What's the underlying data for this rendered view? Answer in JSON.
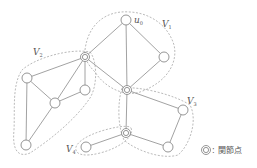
{
  "diagram": {
    "type": "graph-biconnected-components",
    "vertex_label": {
      "base": "u",
      "sub": "0"
    },
    "components": [
      {
        "id": "V1",
        "base": "V",
        "sub": "1"
      },
      {
        "id": "V2",
        "base": "V",
        "sub": "2"
      },
      {
        "id": "V3",
        "base": "V",
        "sub": "3"
      },
      {
        "id": "V4",
        "base": "V",
        "sub": "4"
      }
    ],
    "legend": {
      "symbol": "double-circle",
      "separator": ":",
      "label": "関節点"
    },
    "nodes": [
      {
        "id": "u0",
        "x": 126,
        "y": 20,
        "articulation": false
      },
      {
        "id": "a",
        "x": 85,
        "y": 57,
        "articulation": true
      },
      {
        "id": "b",
        "x": 164,
        "y": 57,
        "articulation": false
      },
      {
        "id": "c",
        "x": 127,
        "y": 90,
        "articulation": true
      },
      {
        "id": "d",
        "x": 27,
        "y": 78,
        "articulation": false
      },
      {
        "id": "e",
        "x": 55,
        "y": 103,
        "articulation": false
      },
      {
        "id": "f",
        "x": 85,
        "y": 90,
        "articulation": false
      },
      {
        "id": "g",
        "x": 26,
        "y": 145,
        "articulation": false
      },
      {
        "id": "h",
        "x": 126,
        "y": 133,
        "articulation": true
      },
      {
        "id": "i",
        "x": 183,
        "y": 110,
        "articulation": false
      },
      {
        "id": "j",
        "x": 168,
        "y": 147,
        "articulation": false
      },
      {
        "id": "k",
        "x": 86,
        "y": 147,
        "articulation": false
      }
    ],
    "edges": [
      [
        "u0",
        "a"
      ],
      [
        "u0",
        "c"
      ],
      [
        "u0",
        "b"
      ],
      [
        "b",
        "c"
      ],
      [
        "a",
        "c"
      ],
      [
        "a",
        "d"
      ],
      [
        "a",
        "e"
      ],
      [
        "a",
        "f"
      ],
      [
        "d",
        "e"
      ],
      [
        "d",
        "g"
      ],
      [
        "e",
        "f"
      ],
      [
        "e",
        "g"
      ],
      [
        "c",
        "h"
      ],
      [
        "c",
        "i"
      ],
      [
        "i",
        "j"
      ],
      [
        "h",
        "j"
      ],
      [
        "h",
        "k"
      ]
    ]
  }
}
